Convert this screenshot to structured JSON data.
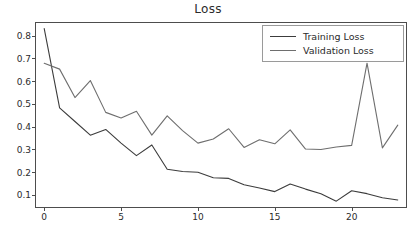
{
  "figure": {
    "title": "Loss",
    "background": "#ffffff",
    "axis_color": "#4d4d4d"
  },
  "legend": {
    "position": "upper-right",
    "border_color": "#9a9a9a",
    "entries": [
      {
        "label": "Training Loss",
        "color": "#3c3c3c"
      },
      {
        "label": "Validation Loss",
        "color": "#6e6e6e"
      }
    ]
  },
  "axes": {
    "x": {
      "ticks": [
        0,
        5,
        10,
        15,
        20
      ],
      "tick_labels": [
        "0",
        "5",
        "10",
        "15",
        "20"
      ],
      "range": [
        -0.6,
        23.6
      ],
      "label": ""
    },
    "y": {
      "ticks": [
        0.1,
        0.2,
        0.3,
        0.4,
        0.5,
        0.6,
        0.7,
        0.8
      ],
      "tick_labels": [
        "0.1",
        "0.2",
        "0.3",
        "0.4",
        "0.5",
        "0.6",
        "0.7",
        "0.8"
      ],
      "range": [
        0.045,
        0.862
      ],
      "label": ""
    },
    "grid": false
  },
  "chart_data": {
    "type": "line",
    "title": "Loss",
    "xlabel": "",
    "ylabel": "",
    "xlim": [
      -0.6,
      23.6
    ],
    "ylim": [
      0.045,
      0.862
    ],
    "grid": false,
    "legend_position": "upper-right",
    "x": [
      0,
      1,
      2,
      3,
      4,
      5,
      6,
      7,
      8,
      9,
      10,
      11,
      12,
      13,
      14,
      15,
      16,
      17,
      18,
      19,
      20,
      21,
      22,
      23
    ],
    "series": [
      {
        "name": "Training Loss",
        "color": "#3c3c3c",
        "values": [
          0.833,
          0.485,
          0.425,
          0.365,
          0.39,
          0.33,
          0.275,
          0.322,
          0.215,
          0.205,
          0.202,
          0.178,
          0.175,
          0.147,
          0.133,
          0.117,
          0.15,
          0.128,
          0.108,
          0.075,
          0.121,
          0.108,
          0.09,
          0.08
        ]
      },
      {
        "name": "Validation Loss",
        "color": "#6e6e6e",
        "values": [
          0.681,
          0.655,
          0.53,
          0.605,
          0.465,
          0.44,
          0.47,
          0.365,
          0.45,
          0.385,
          0.33,
          0.348,
          0.393,
          0.311,
          0.345,
          0.327,
          0.388,
          0.304,
          0.302,
          0.313,
          0.32,
          0.681,
          0.309,
          0.409
        ]
      }
    ]
  }
}
